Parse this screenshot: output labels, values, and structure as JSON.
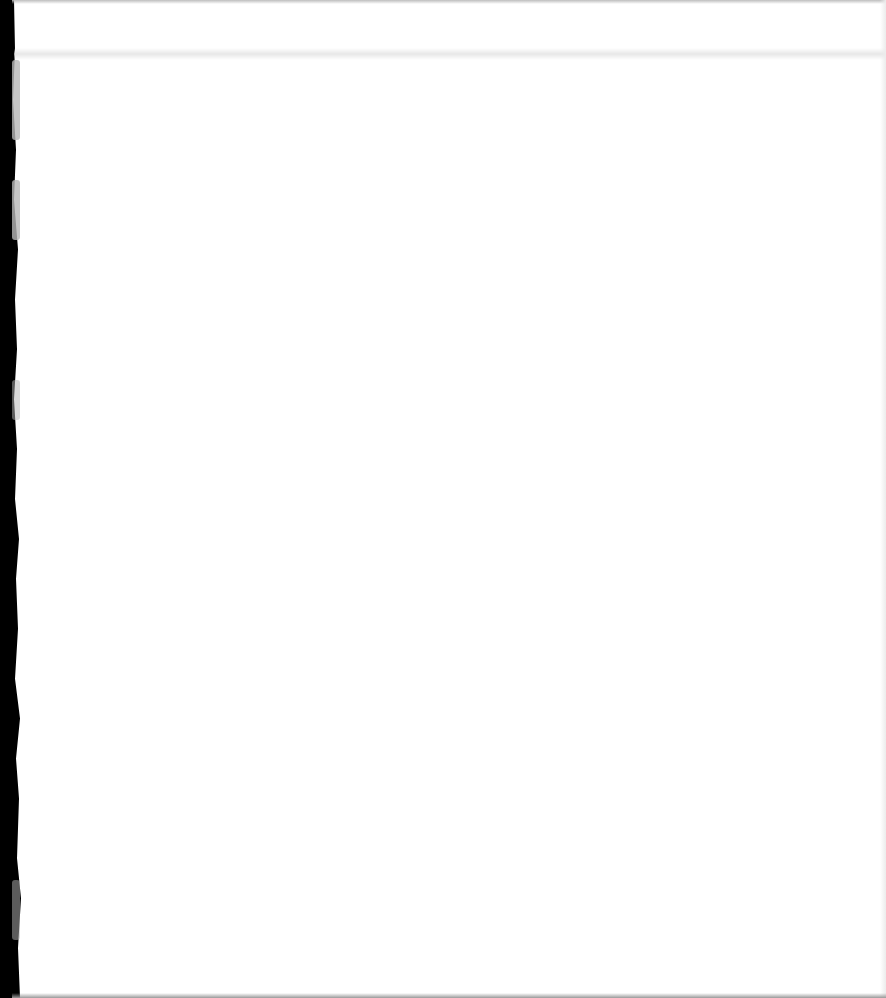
{
  "document": {
    "type": "scanned-page",
    "content": "",
    "text_lines": [],
    "colors": {
      "paper": "#ffffff",
      "margin": "#000000",
      "edge_marks": "#b8b8b8"
    }
  }
}
